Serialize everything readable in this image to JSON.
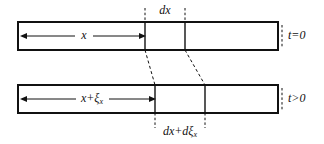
{
  "figure": {
    "kind": "longitudinal-strain-diagram",
    "background_color": "#ffffff",
    "ink_color": "#111111",
    "width": 324,
    "height": 144
  },
  "labels": {
    "top_element_label": "dx",
    "bottom_element_label_main": "dx+d",
    "bottom_element_label_xi": "ξ",
    "bottom_element_label_sub": "x",
    "top_time_label": "t=0",
    "bottom_time_label": "t>0",
    "top_distance_label": "x",
    "bottom_distance_label_main": "x+",
    "bottom_distance_label_xi": "ξ",
    "bottom_distance_label_sub": "x"
  },
  "geometry": {
    "top_bar": {
      "x": 18,
      "y": 22,
      "width": 260,
      "height": 28
    },
    "bottom_bar": {
      "x": 18,
      "y": 85,
      "width": 260,
      "height": 28
    },
    "top_element": {
      "left": 145,
      "right": 185
    },
    "bottom_element": {
      "left": 155,
      "right": 205
    },
    "top_arrow": {
      "x1": 21,
      "x2": 145,
      "y": 36
    },
    "bottom_arrow": {
      "x1": 21,
      "x2": 155,
      "y": 99
    }
  }
}
